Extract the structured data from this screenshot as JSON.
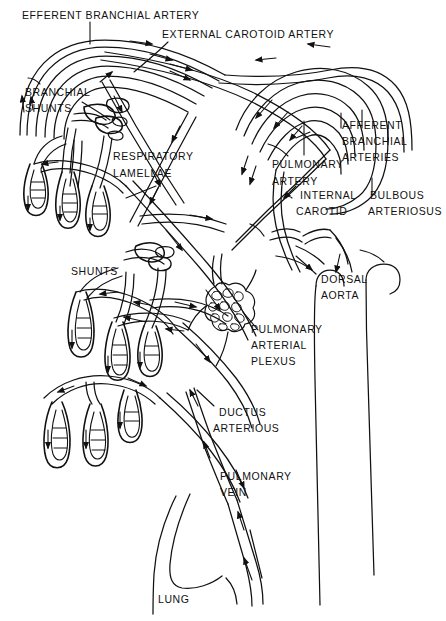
{
  "figure": {
    "kind": "anatomical-diagram",
    "background_color": "#ffffff",
    "ink_color": "#111111",
    "width": 446,
    "height": 621
  },
  "labels": {
    "efferent_branchial_artery": "EFFERENT BRANCHIAL ARTERY",
    "external_carotoid_artery": "EXTERNAL CAROTOID ARTERY",
    "branchial_shunts_line1": "BRANCHIAL",
    "branchial_shunts_line2": "SHUNTS",
    "respiratory_line1": "RESPIRATORY",
    "respiratory_line2": "LAMELLAE",
    "afferent_line1": "AFFERENT",
    "afferent_line2": "BRANCHIAL",
    "afferent_line3": "ARTERIES",
    "pulmonary_artery_line1": "PULMONARY",
    "pulmonary_artery_line2": "ARTERY",
    "internal_carotid_line1": "INTERNAL",
    "internal_carotid_line2": "CAROTID",
    "bulbous_line1": "BULBOUS",
    "bulbous_line2": "ARTERIOSUS",
    "dorsal_aorta_line1": "DORSAL",
    "dorsal_aorta_line2": "AORTA",
    "shunts": "SHUNTS",
    "plexus_line1": "PULMONARY",
    "plexus_line2": "ARTERIAL",
    "plexus_line3": "PLEXUS",
    "ductus_line1": "DUCTUS",
    "ductus_line2": "ARTERIOUS",
    "pulmonary_vein_line1": "PULMONARY",
    "pulmonary_vein_line2": "VEIN",
    "lung": "LUNG"
  },
  "structures": [
    {
      "name": "efferent-branchial-artery",
      "type": "vessel-arc"
    },
    {
      "name": "external-carotoid-artery",
      "type": "vessel-arc"
    },
    {
      "name": "branchial-shunts",
      "type": "vessel-network"
    },
    {
      "name": "respiratory-lamellae",
      "type": "gill-filament-set"
    },
    {
      "name": "afferent-branchial-arteries",
      "type": "vessel-arc-set"
    },
    {
      "name": "pulmonary-artery",
      "type": "vessel"
    },
    {
      "name": "internal-carotid",
      "type": "vessel"
    },
    {
      "name": "bulbous-arteriosus",
      "type": "vessel"
    },
    {
      "name": "dorsal-aorta",
      "type": "vessel-pair"
    },
    {
      "name": "pulmonary-arterial-plexus",
      "type": "capillary-plexus"
    },
    {
      "name": "ductus-arteriosus",
      "type": "vessel"
    },
    {
      "name": "pulmonary-vein",
      "type": "vessel"
    },
    {
      "name": "lung",
      "type": "organ-outline"
    }
  ]
}
